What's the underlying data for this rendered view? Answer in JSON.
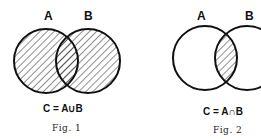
{
  "figures": [
    {
      "set_labels": [
        "A",
        "B"
      ],
      "formula": "C = A∪B",
      "caption": "Fig. 1",
      "shaded_region": "union"
    },
    {
      "set_labels": [
        "A",
        "B"
      ],
      "formula": "C = A∩B",
      "caption": "Fig. 2",
      "shaded_region": "intersection"
    }
  ]
}
